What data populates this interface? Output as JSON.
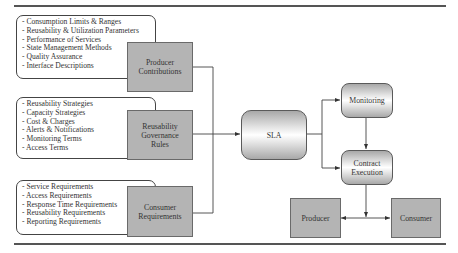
{
  "diagram": {
    "inputs": [
      {
        "id": "producer-contributions",
        "label": "Producer\nContributions",
        "items": [
          "- Consumption Limits & Ranges",
          "- Reusability & Utilization Parameters",
          "- Performance of Services",
          "- State Management Methods",
          "- Quality Assurance",
          "- Interface Descriptions"
        ]
      },
      {
        "id": "reusability-governance-rules",
        "label": "Reusability\nGovernance\nRules",
        "items": [
          "- Reusability Strategies",
          "- Capacity Strategies",
          "- Cost & Charges",
          "- Alerts & Notifications",
          "- Monitoring Terms",
          "- Access Terms"
        ]
      },
      {
        "id": "consumer-requirements",
        "label": "Consumer\nRequirements",
        "items": [
          "- Service Requirements",
          "- Access Requirements",
          "- Response Time Requirements",
          "- Reusability Requirements",
          "- Reporting Requirements"
        ]
      }
    ],
    "sla": {
      "label": "SLA"
    },
    "monitoring": {
      "label": "Monitoring"
    },
    "contract_execution": {
      "label": "Contract\nExecution"
    },
    "producer": {
      "label": "Producer"
    },
    "consumer": {
      "label": "Consumer"
    },
    "edges": [
      {
        "from": "Producer Contributions",
        "to": "SLA"
      },
      {
        "from": "Reusability Governance Rules",
        "to": "SLA"
      },
      {
        "from": "Consumer Requirements",
        "to": "SLA"
      },
      {
        "from": "SLA",
        "to": "Monitoring"
      },
      {
        "from": "SLA",
        "to": "Contract Execution"
      },
      {
        "from": "Monitoring",
        "to": "Contract Execution"
      },
      {
        "from": "Contract Execution",
        "to": "Producer"
      },
      {
        "from": "Contract Execution",
        "to": "Consumer"
      }
    ]
  }
}
